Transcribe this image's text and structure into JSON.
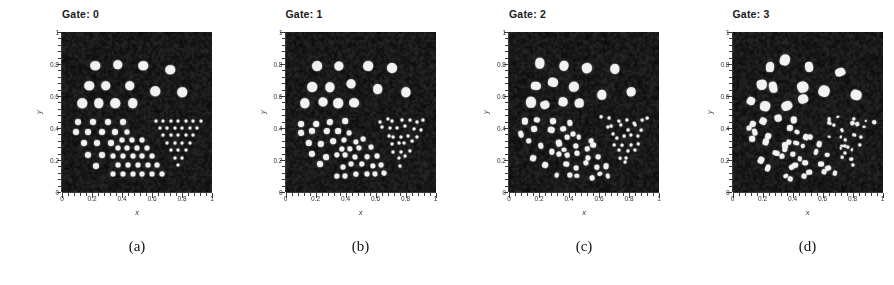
{
  "figure": {
    "panel_count": 4,
    "background_color": "#0a0a0a",
    "blob_color": "#f2f2f2",
    "axis_color": "#303030"
  },
  "axes": {
    "xlabel": "x",
    "ylabel": "y",
    "xlim": [
      0,
      1
    ],
    "ylim": [
      0,
      1
    ],
    "xticks": [
      "0",
      "0.2",
      "0.4",
      "0.6",
      "0.8",
      "1"
    ],
    "yticks": [
      "0",
      "0.2",
      "0.4",
      "0.6",
      "0.8",
      "1"
    ],
    "xtick_values": [
      0,
      0.2,
      0.4,
      0.6,
      0.8,
      1
    ],
    "ytick_values": [
      0,
      0.2,
      0.4,
      0.6,
      0.8,
      1
    ],
    "minor_ticks_per_interval": 4,
    "grid": false
  },
  "panels": [
    {
      "title": "Gate: 0",
      "caption": "(a)",
      "gate": 0,
      "jitter": 0.0,
      "shape_irregularity": 0.0
    },
    {
      "title": "Gate: 1",
      "caption": "(b)",
      "gate": 1,
      "jitter": 0.012,
      "shape_irregularity": 0.14
    },
    {
      "title": "Gate: 2",
      "caption": "(c)",
      "gate": 2,
      "jitter": 0.022,
      "shape_irregularity": 0.3
    },
    {
      "title": "Gate: 3",
      "caption": "(d)",
      "gate": 3,
      "jitter": 0.032,
      "shape_irregularity": 0.48
    }
  ],
  "chart_data": {
    "type": "scatter",
    "title": "",
    "xlabel": "x",
    "ylabel": "y",
    "xlim": [
      0,
      1
    ],
    "ylim": [
      0,
      1
    ],
    "grid": false,
    "legend": null,
    "clusters": [
      {
        "name": "large-circles-upper",
        "marker_size": 9.5,
        "points": [
          [
            0.22,
            0.79
          ],
          [
            0.37,
            0.795
          ],
          [
            0.54,
            0.79
          ],
          [
            0.72,
            0.765
          ],
          [
            0.18,
            0.665
          ],
          [
            0.29,
            0.665
          ],
          [
            0.45,
            0.665
          ],
          [
            0.62,
            0.63
          ],
          [
            0.8,
            0.625
          ],
          [
            0.135,
            0.555
          ],
          [
            0.245,
            0.555
          ],
          [
            0.355,
            0.555
          ],
          [
            0.47,
            0.555
          ]
        ]
      },
      {
        "name": "medium-dots-left",
        "marker_size": 6.0,
        "points": [
          [
            0.105,
            0.435
          ],
          [
            0.205,
            0.435
          ],
          [
            0.305,
            0.435
          ],
          [
            0.405,
            0.435
          ],
          [
            0.095,
            0.375
          ],
          [
            0.175,
            0.375
          ],
          [
            0.265,
            0.375
          ],
          [
            0.355,
            0.375
          ],
          [
            0.145,
            0.305
          ],
          [
            0.235,
            0.305
          ],
          [
            0.325,
            0.305
          ],
          [
            0.175,
            0.23
          ],
          [
            0.265,
            0.23
          ],
          [
            0.225,
            0.165
          ]
        ]
      },
      {
        "name": "medium-triangle-center-bottom",
        "marker_size": 5.0,
        "points": [
          [
            0.435,
            0.375
          ],
          [
            0.4,
            0.325
          ],
          [
            0.465,
            0.325
          ],
          [
            0.53,
            0.325
          ],
          [
            0.37,
            0.275
          ],
          [
            0.435,
            0.275
          ],
          [
            0.5,
            0.275
          ],
          [
            0.565,
            0.275
          ],
          [
            0.34,
            0.225
          ],
          [
            0.405,
            0.225
          ],
          [
            0.47,
            0.225
          ],
          [
            0.535,
            0.225
          ],
          [
            0.6,
            0.225
          ],
          [
            0.375,
            0.17
          ],
          [
            0.44,
            0.17
          ],
          [
            0.505,
            0.17
          ],
          [
            0.57,
            0.17
          ],
          [
            0.635,
            0.17
          ],
          [
            0.34,
            0.11
          ],
          [
            0.405,
            0.11
          ],
          [
            0.47,
            0.11
          ],
          [
            0.535,
            0.11
          ],
          [
            0.6,
            0.11
          ],
          [
            0.665,
            0.11
          ]
        ]
      },
      {
        "name": "small-dots-inverted-triangle-right",
        "marker_size": 3.0,
        "points": [
          [
            0.625,
            0.445
          ],
          [
            0.675,
            0.445
          ],
          [
            0.725,
            0.445
          ],
          [
            0.775,
            0.445
          ],
          [
            0.825,
            0.445
          ],
          [
            0.875,
            0.445
          ],
          [
            0.925,
            0.445
          ],
          [
            0.65,
            0.4
          ],
          [
            0.7,
            0.4
          ],
          [
            0.75,
            0.4
          ],
          [
            0.8,
            0.4
          ],
          [
            0.85,
            0.4
          ],
          [
            0.9,
            0.4
          ],
          [
            0.675,
            0.355
          ],
          [
            0.725,
            0.355
          ],
          [
            0.775,
            0.355
          ],
          [
            0.825,
            0.355
          ],
          [
            0.875,
            0.355
          ],
          [
            0.7,
            0.305
          ],
          [
            0.75,
            0.305
          ],
          [
            0.8,
            0.305
          ],
          [
            0.85,
            0.305
          ],
          [
            0.725,
            0.26
          ],
          [
            0.775,
            0.26
          ],
          [
            0.825,
            0.26
          ],
          [
            0.75,
            0.215
          ],
          [
            0.8,
            0.215
          ],
          [
            0.775,
            0.17
          ]
        ]
      }
    ]
  }
}
